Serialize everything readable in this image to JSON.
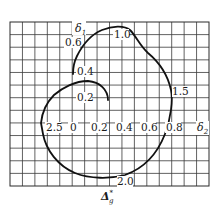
{
  "figure": {
    "title": "",
    "axis_labels": {
      "horizontal": "δ",
      "horizontal_sub": "2",
      "vertical": "δ",
      "vertical_sub": "1",
      "curve_label": "Δ",
      "curve_label_sup": "*",
      "curve_label_sub": "g"
    },
    "horizontal_ticks": [
      "2.5",
      "0",
      "0.2",
      "0.4",
      "0.6",
      "0.8"
    ],
    "vertical_ticks": [
      "0.6",
      "0.4",
      "0.2"
    ],
    "curve_annotations": [
      "1.0",
      "1.5",
      "2.0"
    ],
    "colors": {
      "grid": "#3a3a3a",
      "curve": "#111111",
      "background": "#ffffff"
    }
  },
  "chart_data": {
    "type": "line",
    "title": "",
    "xlabel": "δ2",
    "ylabel": "δ1",
    "curve_name": "Δ*g",
    "x_tick_labels": [
      "2.5",
      "0",
      "0.2",
      "0.4",
      "0.6",
      "0.8"
    ],
    "y_tick_labels": [
      "0.2",
      "0.4",
      "0.6"
    ],
    "annotations": [
      {
        "label": "0.2",
        "approx_x": 0.0,
        "approx_y": 0.2
      },
      {
        "label": "0.4",
        "approx_x": 0.0,
        "approx_y": 0.4
      },
      {
        "label": "0.6",
        "approx_x": 0.0,
        "approx_y": 0.6
      },
      {
        "label": "1.0",
        "approx_x": 0.4,
        "approx_y": 0.75
      },
      {
        "label": "1.5",
        "approx_x": 0.8,
        "approx_y": 0.27
      },
      {
        "label": "2.0",
        "approx_x": 0.4,
        "approx_y": -0.4
      },
      {
        "label": "2.5",
        "approx_x": -0.25,
        "approx_y": 0.0
      }
    ],
    "grid": true,
    "legend": "none"
  }
}
